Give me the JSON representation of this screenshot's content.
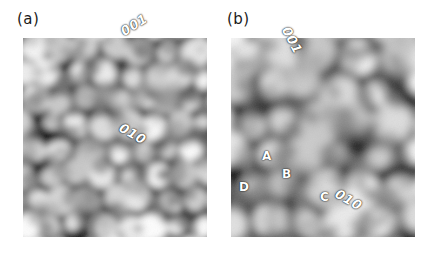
{
  "figure": {
    "background_color": "#ffffff",
    "annotation_color": "#ffffff",
    "label_color": "#1a1a1a"
  },
  "panels": [
    {
      "id": "a",
      "label": "(a)",
      "label_x": 17,
      "label_y": 10,
      "image": {
        "x": 23,
        "y": 38,
        "width": 184,
        "height": 199
      },
      "direction_arrows": [
        {
          "name": "001",
          "label": "001",
          "origin_x": 99,
          "origin_y": 92,
          "tip_x": 130,
          "tip_y": 52,
          "label_x": 118,
          "label_y": 26,
          "label_rotation": -32
        },
        {
          "name": "010",
          "label": "010",
          "origin_x": 99,
          "origin_y": 92,
          "tip_x": 139,
          "tip_y": 123,
          "label_x": 124,
          "label_y": 120,
          "label_rotation": 30
        }
      ],
      "site_labels": [],
      "rectangle": null
    },
    {
      "id": "b",
      "label": "(b)",
      "label_x": 227,
      "label_y": 10,
      "image": {
        "x": 231,
        "y": 38,
        "width": 184,
        "height": 199
      },
      "direction_arrows": [
        {
          "name": "001",
          "label": "001",
          "origin_x": 278,
          "origin_y": 100,
          "tip_x": 287,
          "tip_y": 48,
          "label_x": 292,
          "label_y": 24,
          "label_rotation": 62
        },
        {
          "name": "010",
          "label": "010",
          "origin_x": 278,
          "origin_y": 100,
          "tip_x": 345,
          "tip_y": 190,
          "label_x": 340,
          "label_y": 186,
          "label_rotation": 30
        }
      ],
      "site_labels": [
        {
          "text": "A",
          "x": 262,
          "y": 149
        },
        {
          "text": "B",
          "x": 282,
          "y": 167
        },
        {
          "text": "C",
          "x": 320,
          "y": 190
        },
        {
          "text": "D",
          "x": 239,
          "y": 180
        }
      ],
      "rectangle": {
        "corners": [
          {
            "x": 248,
            "y": 117
          },
          {
            "x": 281,
            "y": 62
          },
          {
            "x": 350,
            "y": 129
          },
          {
            "x": 320,
            "y": 182
          }
        ]
      }
    }
  ]
}
